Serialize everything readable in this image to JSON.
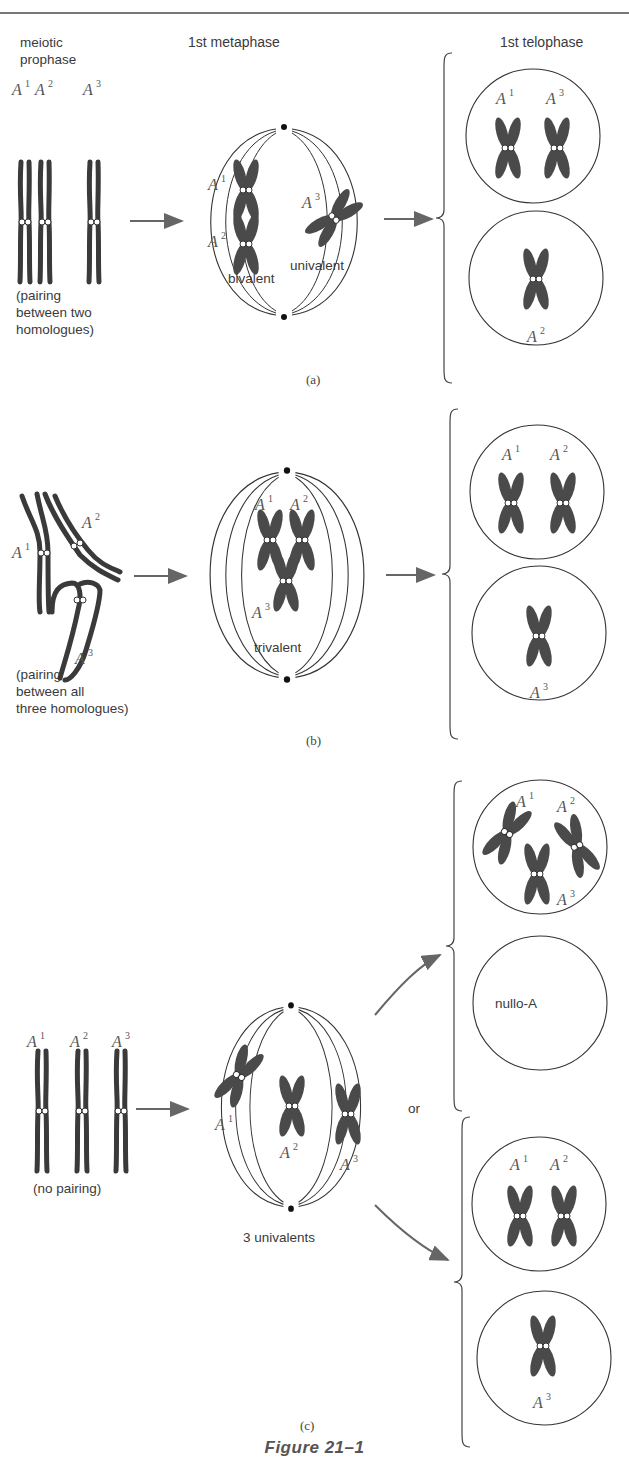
{
  "figure": {
    "caption": "Figure 21–1",
    "column_headers": {
      "prophase": "meiotic\nprophase",
      "metaphase": "1st metaphase",
      "telophase": "1st telophase"
    },
    "colors": {
      "chromosome_fill": "#4a4a4a",
      "line": "#333333",
      "arrow": "#666666",
      "background": "#ffffff"
    },
    "panels": [
      {
        "id": "a",
        "label": "(a)",
        "prophase_note": "(pairing\nbetween two\nhomologues)",
        "prophase_chromosomes": [
          "A1",
          "A2",
          "A3"
        ],
        "metaphase_structures": [
          "bivalent",
          "univalent"
        ],
        "metaphase_labels": {
          "bivalent": "bivalent",
          "univalent": "univalent"
        },
        "telophase_cells": [
          {
            "chromosomes": [
              "A1",
              "A3"
            ]
          },
          {
            "chromosomes": [
              "A2"
            ]
          }
        ]
      },
      {
        "id": "b",
        "label": "(b)",
        "prophase_note": "(pairing\nbetween all\nthree homologues)",
        "prophase_chromosomes": [
          "A1",
          "A2",
          "A3"
        ],
        "metaphase_structures": [
          "trivalent"
        ],
        "metaphase_labels": {
          "trivalent": "trivalent"
        },
        "telophase_cells": [
          {
            "chromosomes": [
              "A1",
              "A2"
            ]
          },
          {
            "chromosomes": [
              "A3"
            ]
          }
        ]
      },
      {
        "id": "c",
        "label": "(c)",
        "prophase_note": "(no pairing)",
        "prophase_chromosomes": [
          "A1",
          "A2",
          "A3"
        ],
        "metaphase_structures": [
          "3 univalents"
        ],
        "metaphase_labels": {
          "univalents": "3 univalents"
        },
        "or_label": "or",
        "telophase_options": [
          [
            {
              "chromosomes": [
                "A1",
                "A2",
                "A3"
              ]
            },
            {
              "chromosomes": [],
              "label": "nullo-A"
            }
          ],
          [
            {
              "chromosomes": [
                "A1",
                "A2"
              ]
            },
            {
              "chromosomes": [
                "A3"
              ]
            }
          ]
        ]
      }
    ]
  }
}
